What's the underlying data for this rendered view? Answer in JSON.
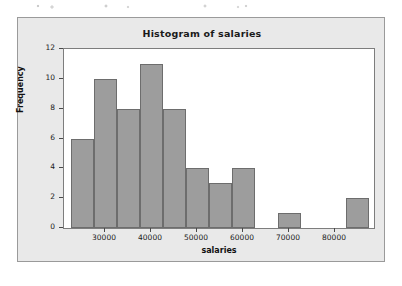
{
  "figure": {
    "title": "Histogram of salaries",
    "panel_bg": "#e9e9e9",
    "plot_bg": "#ffffff",
    "bar_fill": "#9d9d9d",
    "bar_edge": "#6d6d6d"
  },
  "chart_data": {
    "type": "bar",
    "title": "Histogram of salaries",
    "subtitle": "",
    "xlabel": "salaries",
    "ylabel": "Frequency",
    "bin_width": 5000,
    "bin_starts": [
      22500,
      27500,
      32500,
      37500,
      42500,
      47500,
      52500,
      57500,
      62500,
      67500,
      72500,
      77500,
      82500
    ],
    "bin_ends": [
      27500,
      32500,
      37500,
      42500,
      47500,
      52500,
      57500,
      62500,
      67500,
      72500,
      77500,
      82500,
      87500
    ],
    "categories": [
      "22500-27500",
      "27500-32500",
      "32500-37500",
      "37500-42500",
      "42500-47500",
      "47500-52500",
      "52500-57500",
      "57500-62500",
      "62500-67500",
      "67500-72500",
      "72500-77500",
      "77500-82500",
      "82500-87500"
    ],
    "values": [
      6,
      10,
      8,
      11,
      8,
      4,
      3,
      4,
      0,
      1,
      0,
      0,
      2
    ],
    "xlim": [
      21000,
      88500
    ],
    "ylim": [
      0,
      12
    ],
    "xticks": [
      30000,
      40000,
      50000,
      60000,
      70000,
      80000
    ],
    "xticklabels": [
      "30000",
      "40000",
      "50000",
      "60000",
      "70000",
      "80000"
    ],
    "yticks": [
      0,
      2,
      4,
      6,
      8,
      10,
      12
    ],
    "yticklabels": [
      "0",
      "2",
      "4",
      "6",
      "8",
      "10",
      "12"
    ],
    "grid": false,
    "legend": null,
    "total_count": 57
  }
}
